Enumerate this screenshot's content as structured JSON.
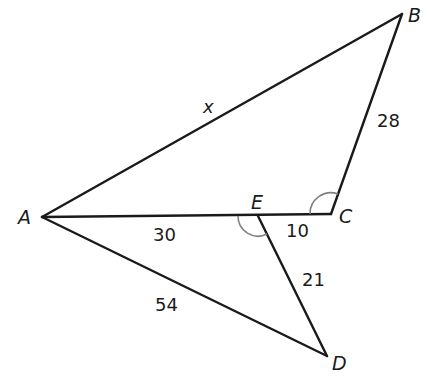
{
  "diagram": {
    "type": "geometry-triangles",
    "points": {
      "A": {
        "label": "A",
        "x": 42,
        "y": 217
      },
      "B": {
        "label": "B",
        "x": 402,
        "y": 14
      },
      "C": {
        "label": "C",
        "x": 331,
        "y": 214
      },
      "D": {
        "label": "D",
        "x": 327,
        "y": 356
      },
      "E": {
        "label": "E",
        "x": 258,
        "y": 216
      }
    },
    "segments": [
      {
        "name": "AB",
        "from": "A",
        "to": "B",
        "label": "x"
      },
      {
        "name": "BC",
        "from": "B",
        "to": "C",
        "label": "28"
      },
      {
        "name": "AE",
        "from": "A",
        "to": "E",
        "label": "30"
      },
      {
        "name": "EC",
        "from": "E",
        "to": "C",
        "label": "10"
      },
      {
        "name": "ED",
        "from": "E",
        "to": "D",
        "label": "21"
      },
      {
        "name": "AD",
        "from": "A",
        "to": "D",
        "label": "54"
      }
    ],
    "angle_marks": [
      {
        "vertex": "C",
        "between": [
          "A",
          "B"
        ],
        "style": "single-arc"
      },
      {
        "vertex": "E",
        "between": [
          "A",
          "D"
        ],
        "style": "single-arc"
      }
    ],
    "labels": {
      "A": "A",
      "B": "B",
      "C": "C",
      "D": "D",
      "E": "E",
      "x": "x",
      "s28": "28",
      "s30": "30",
      "s10": "10",
      "s21": "21",
      "s54": "54"
    }
  }
}
